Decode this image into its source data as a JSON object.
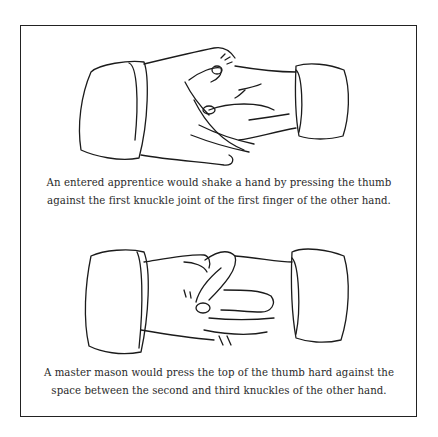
{
  "figures": [
    {
      "id": "entered-apprentice",
      "caption_lines": [
        "An entered apprentice would shake a hand by pressing the thumb",
        "against the first knuckle joint of the first finger of the other hand."
      ]
    },
    {
      "id": "master-mason",
      "caption_lines": [
        "A master mason would press the top of the thumb hard against the",
        "space between the second and third knuckles of the other hand."
      ]
    }
  ],
  "colors": {
    "line": "#1b1b1b",
    "text": "#2a2a2a",
    "border": "#222222",
    "background": "#ffffff"
  }
}
